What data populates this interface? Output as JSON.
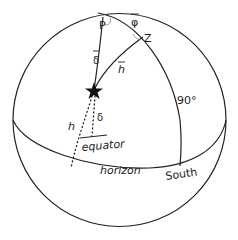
{
  "diagram": {
    "type": "celestial-sphere",
    "labels": {
      "pole": "P",
      "zenith": "Z",
      "colatitude": "φ",
      "polar_distance": "δ",
      "zenith_distance": "h",
      "right_angle": "90°",
      "altitude": "h",
      "declination": "δ",
      "equator": "equator",
      "horizon": "horizon",
      "south": "South"
    },
    "colors": {
      "stroke": "#222222",
      "background": "#ffffff"
    }
  }
}
